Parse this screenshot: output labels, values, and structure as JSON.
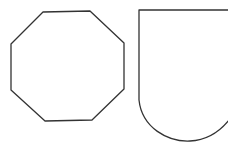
{
  "canvas": {
    "width": 228,
    "height": 150,
    "background": "#ffffff"
  },
  "stroke": {
    "color": "#333333",
    "width": 1.3
  },
  "shapes": [
    {
      "name": "octagon",
      "type": "polygon",
      "points": "43,12 90,11 124,43 124,89 92,120 45,121 11,90 11,44"
    },
    {
      "name": "shield",
      "type": "path",
      "d": "M 229 10 L 139 10 L 139 100 C 142 128 168 142 190 141 C 208 140 222 130 232 116"
    }
  ]
}
